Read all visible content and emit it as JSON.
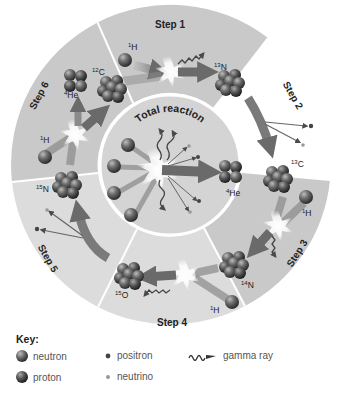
{
  "center": {
    "label": "Total reaction",
    "product": "4He",
    "product_sup": "4",
    "product_sym": "He"
  },
  "steps": [
    {
      "label": "Step 1",
      "inputs": [
        "12C",
        "1H"
      ],
      "output": "13N",
      "emits": [
        "gamma ray"
      ]
    },
    {
      "label": "Step 2",
      "inputs": [
        "13N"
      ],
      "output": "13C",
      "emits": [
        "positron",
        "neutrino"
      ]
    },
    {
      "label": "Step 3",
      "inputs": [
        "13C",
        "1H"
      ],
      "output": "14N",
      "emits": [
        "gamma ray"
      ]
    },
    {
      "label": "Step 4",
      "inputs": [
        "14N",
        "1H"
      ],
      "output": "15O",
      "emits": [
        "gamma ray"
      ]
    },
    {
      "label": "Step 5",
      "inputs": [
        "15O"
      ],
      "output": "15N",
      "emits": [
        "positron",
        "neutrino"
      ]
    },
    {
      "label": "Step 6",
      "inputs": [
        "15N",
        "1H"
      ],
      "output": "12C",
      "emits": [
        "4He"
      ]
    }
  ],
  "isotopes": {
    "h1": {
      "sup": "1",
      "sym": "H"
    },
    "c12": {
      "sup": "12",
      "sym": "C"
    },
    "n13": {
      "sup": "13",
      "sym": "N"
    },
    "c13": {
      "sup": "13",
      "sym": "C"
    },
    "n14": {
      "sup": "14",
      "sym": "N"
    },
    "o15": {
      "sup": "15",
      "sym": "O"
    },
    "n15": {
      "sup": "15",
      "sym": "N"
    },
    "he4": {
      "sup": "4",
      "sym": "He"
    }
  },
  "key": {
    "title": "Key:",
    "items": [
      {
        "label": "neutron",
        "icon": "neutron-sphere-icon"
      },
      {
        "label": "proton",
        "icon": "proton-sphere-icon"
      },
      {
        "label": "positron",
        "icon": "positron-dot-icon"
      },
      {
        "label": "neutrino",
        "icon": "neutrino-dot-icon"
      },
      {
        "label": "gamma ray",
        "icon": "gamma-ray-wave-icon"
      }
    ]
  },
  "colors": {
    "ring_dark": "#c8c8c8",
    "ring_light": "#dcdcdc",
    "center": "#d4d4d4",
    "arrow": "#7a7a7a",
    "particle": "#5a5a5a"
  }
}
